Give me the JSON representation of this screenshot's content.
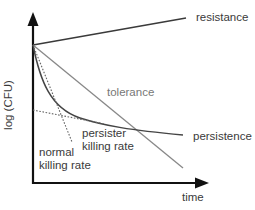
{
  "diagram": {
    "axes": {
      "x_label": "time",
      "y_label": "log (CFU)"
    },
    "curves": {
      "resistance": "resistance",
      "tolerance": "tolerance",
      "persistence": "persistence"
    },
    "annotations": {
      "persister_line1": "persister",
      "persister_line2": "killing rate",
      "normal_line1": "normal",
      "normal_line2": "killing rate"
    },
    "colors": {
      "axis": "#111111",
      "resistance": "#3a3a3a",
      "tolerance": "#888888",
      "persistence": "#444444",
      "dotted": "#666666"
    }
  }
}
